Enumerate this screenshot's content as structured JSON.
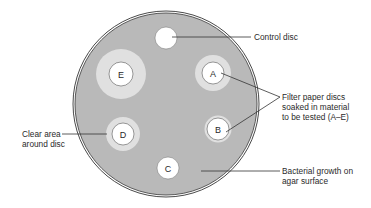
{
  "figure": {
    "colors": {
      "background": "#ffffff",
      "agar": "#b9b9b9",
      "rim": "#4a4a4a",
      "clear_zone": "#e0e0e0",
      "disc": "#ffffff",
      "line": "#333333"
    },
    "dish": {
      "cx": 166,
      "cy": 104,
      "r": 92
    },
    "control_disc": {
      "cx": 166,
      "cy": 38,
      "r": 11
    },
    "discs": [
      {
        "letter": "A",
        "cx": 213,
        "cy": 73,
        "disc_r": 11,
        "zone_r": 18
      },
      {
        "letter": "B",
        "cx": 218,
        "cy": 129,
        "disc_r": 11,
        "zone_r": 13
      },
      {
        "letter": "C",
        "cx": 168,
        "cy": 168,
        "disc_r": 11,
        "zone_r": 11
      },
      {
        "letter": "D",
        "cx": 123,
        "cy": 134,
        "disc_r": 11,
        "zone_r": 17
      },
      {
        "letter": "E",
        "cx": 121,
        "cy": 74,
        "disc_r": 12,
        "zone_r": 25
      }
    ],
    "labels": {
      "control": "Control disc",
      "filter_line1": "Filter paper discs",
      "filter_line2": "soaked in material",
      "filter_line3": "to be tested (A–E)",
      "clear_line1": "Clear area",
      "clear_line2": "around disc",
      "growth_line1": "Bacterial growth on",
      "growth_line2": "agar surface"
    }
  }
}
